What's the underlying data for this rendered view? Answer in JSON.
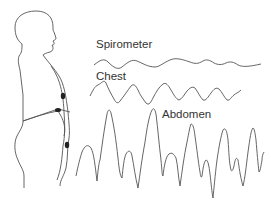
{
  "diagram": {
    "labels": {
      "spirometer": "Spirometer",
      "chest": "Chest",
      "abdomen": "Abdomen"
    },
    "colors": {
      "line": "#555555",
      "text": "#333333",
      "background": "#ffffff"
    },
    "components": [
      {
        "name": "human-figure-outline",
        "description": "Side profile of person with chest and abdominal bands"
      },
      {
        "name": "chest-band",
        "description": "Band around chest with sensor"
      },
      {
        "name": "abdomen-band",
        "description": "Band around abdomen with sensor"
      }
    ]
  }
}
